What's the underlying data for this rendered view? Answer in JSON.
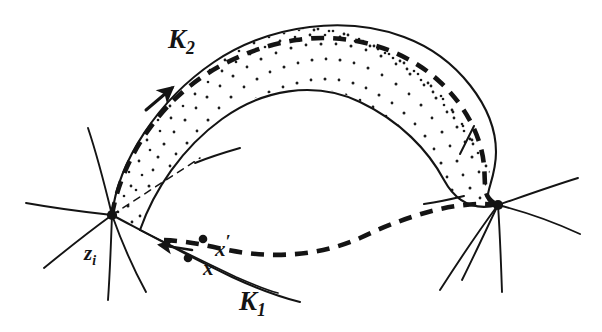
{
  "figure": {
    "background_color": "#ffffff",
    "ink_color": "#141414",
    "width": 602,
    "height": 332,
    "labels": {
      "k2": "K",
      "k2_sub": "2",
      "k1": "K",
      "k1_sub": "1",
      "zi": "z",
      "zi_sub": "i",
      "x_prime": "x",
      "x_prime_mark": "′",
      "x": "x"
    },
    "elements": {
      "band_name": "stippled-annulus-band",
      "dashed_curve_name": "thick-dashed-core-curve",
      "node_left_name": "singular-point-zi",
      "node_right_name": "singular-point-right",
      "point_x_name": "point-x",
      "point_x_prime_name": "point-x-prime",
      "arrow_upper_name": "direction-arrow-upper",
      "arrow_lower_name": "direction-arrow-lower"
    },
    "geometry": {
      "node_left": [
        112,
        215
      ],
      "node_right": [
        498,
        205
      ],
      "point_x": [
        188,
        258
      ],
      "point_x_prime": [
        203,
        239
      ],
      "stipple_dot_count": 260,
      "dash_pattern_thick": "13 9",
      "dash_pattern_thin": "7 6"
    }
  }
}
